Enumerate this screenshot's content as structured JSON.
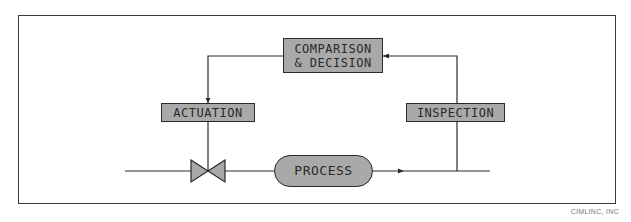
{
  "diagram": {
    "type": "closed-loop control diagram",
    "nodes": {
      "comparison": {
        "label": "COMPARISON\n& DECISION"
      },
      "actuation": {
        "label": "ACTUATION"
      },
      "inspection": {
        "label": "INSPECTION"
      },
      "process": {
        "label": "PROCESS"
      },
      "valve": {
        "label": ""
      }
    },
    "edges": [
      {
        "from": "comparison",
        "to": "actuation"
      },
      {
        "from": "actuation",
        "to": "valve"
      },
      {
        "from": "valve",
        "to": "process"
      },
      {
        "from": "process",
        "to": "inspection"
      },
      {
        "from": "inspection",
        "to": "comparison"
      }
    ],
    "colors": {
      "box_fill": "#a9a9a9",
      "stroke": "#2a2a2a"
    }
  },
  "credit": "CIMLINC, INC"
}
